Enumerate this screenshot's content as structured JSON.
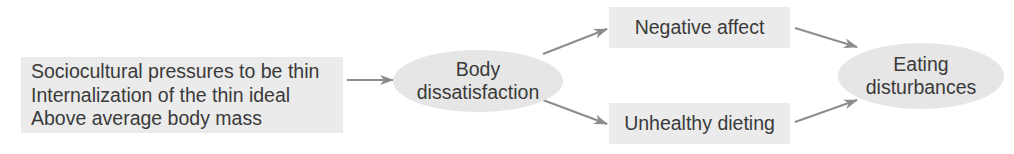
{
  "diagram": {
    "type": "flow",
    "nodes": {
      "risk_factors": {
        "shape": "rectangle",
        "lines": [
          "Sociocultural pressures to be thin",
          "Internalization of the thin ideal",
          "Above average body mass"
        ]
      },
      "body_dissatisfaction": {
        "shape": "ellipse",
        "lines": [
          "Body",
          "dissatisfaction"
        ]
      },
      "negative_affect": {
        "shape": "rectangle",
        "label": "Negative affect"
      },
      "unhealthy_dieting": {
        "shape": "rectangle",
        "label": "Unhealthy dieting"
      },
      "eating_disturbances": {
        "shape": "ellipse",
        "lines": [
          "Eating",
          "disturbances"
        ]
      }
    },
    "edges": [
      {
        "from": "risk_factors",
        "to": "body_dissatisfaction"
      },
      {
        "from": "body_dissatisfaction",
        "to": "negative_affect"
      },
      {
        "from": "body_dissatisfaction",
        "to": "unhealthy_dieting"
      },
      {
        "from": "negative_affect",
        "to": "eating_disturbances"
      },
      {
        "from": "unhealthy_dieting",
        "to": "eating_disturbances"
      }
    ],
    "colors": {
      "box_fill": "#ebebeb",
      "arrow": "#8c8c8c",
      "text": "#3a3a3a"
    }
  }
}
